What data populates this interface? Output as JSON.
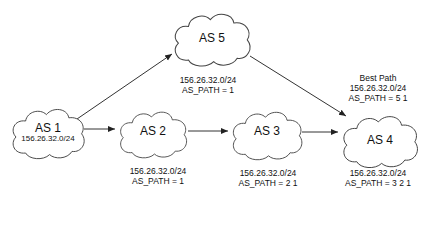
{
  "diagram": {
    "nodes": [
      {
        "id": "as1",
        "label": "AS 1",
        "prefix": "156.26.32.0/24"
      },
      {
        "id": "as2",
        "label": "AS 2"
      },
      {
        "id": "as3",
        "label": "AS 3"
      },
      {
        "id": "as4",
        "label": "AS 4"
      },
      {
        "id": "as5",
        "label": "AS 5"
      }
    ],
    "edges": [
      {
        "from": "as1",
        "to": "as5"
      },
      {
        "from": "as1",
        "to": "as2"
      },
      {
        "from": "as2",
        "to": "as3"
      },
      {
        "from": "as3",
        "to": "as4"
      },
      {
        "from": "as5",
        "to": "as4"
      }
    ],
    "annotations": {
      "as5": {
        "prefix": "156.26.32.0/24",
        "as_path": "AS_PATH = 1"
      },
      "as2": {
        "prefix": "156.26.32.0/24",
        "as_path": "AS_PATH = 1"
      },
      "as3": {
        "prefix": "156.26.32.0/24",
        "as_path": "AS_PATH = 2 1"
      },
      "as4_best": {
        "title": "Best Path",
        "prefix": "156.26.32.0/24",
        "as_path": "AS_PATH = 5 1"
      },
      "as4_alt": {
        "prefix": "156.26.32.0/24",
        "as_path": "AS_PATH = 3 2 1"
      }
    },
    "colors": {
      "stroke": "#333333",
      "fill": "#ffffff",
      "text": "#111111"
    }
  }
}
